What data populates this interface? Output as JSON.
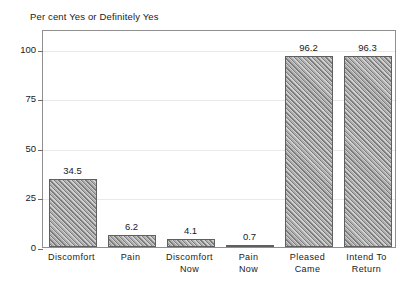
{
  "chart_data": {
    "type": "bar",
    "title": "Per cent Yes or Definitely Yes",
    "xlabel": "",
    "ylabel": "",
    "ylim": [
      0,
      110
    ],
    "yticks": [
      0,
      25,
      50,
      75,
      100
    ],
    "ytick_labels": [
      "0",
      "25",
      "50",
      "75",
      "100"
    ],
    "grid": true,
    "legend": "none",
    "categories": [
      "Discomfort",
      "Pain",
      "Discomfort\nNow",
      "Pain\nNow",
      "Pleased\nCame",
      "Intend To\nReturn"
    ],
    "values": [
      34.5,
      6.2,
      4.1,
      0.7,
      96.2,
      96.3
    ],
    "value_labels": [
      "34.5",
      "6.2",
      "4.1",
      "0.7",
      "96.2",
      "96.3"
    ],
    "bar_fill": "#9a9a9a",
    "bar_edge": "#5f5f5f",
    "bar_hatch": "diagonal",
    "frame_color": "#8f8f8f",
    "grid_color": "#e9e9e9",
    "background": "#ffffff",
    "text_color": "#1a1a1a"
  }
}
